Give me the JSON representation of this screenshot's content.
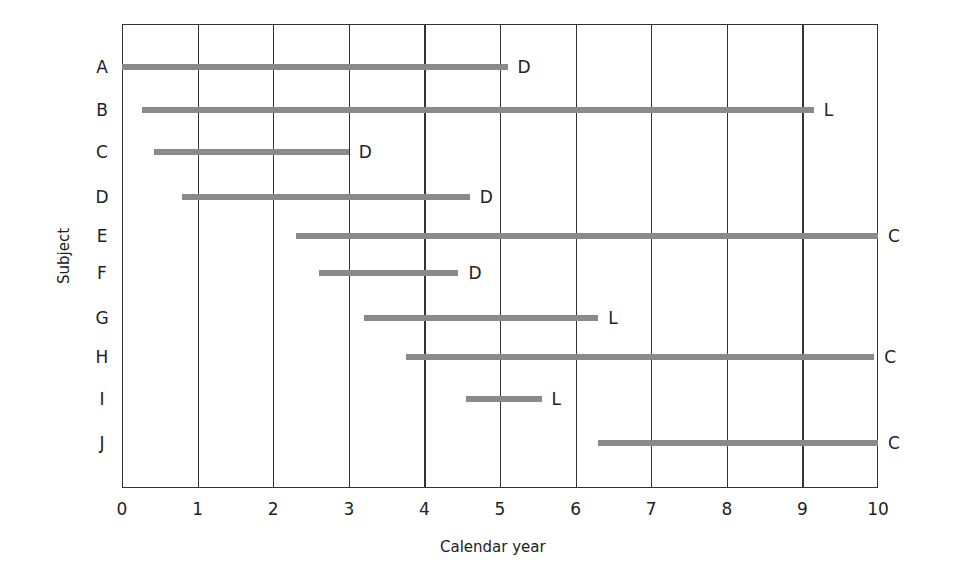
{
  "chart_data": {
    "type": "bar",
    "orientation": "horizontal",
    "subtype": "swimmer/timeline",
    "title": "",
    "xlabel": "Calendar year",
    "ylabel": "Subject",
    "xlim": [
      0,
      10
    ],
    "xticks": [
      "0",
      "1",
      "2",
      "3",
      "4",
      "5",
      "6",
      "7",
      "8",
      "9",
      "10"
    ],
    "grid": {
      "vertical": true,
      "horizontal": false
    },
    "bar_color": "#8a8a8a",
    "categories": [
      "A",
      "B",
      "C",
      "D",
      "E",
      "F",
      "G",
      "H",
      "I",
      "J"
    ],
    "series": [
      {
        "subject": "A",
        "start": 0.0,
        "end": 5.1,
        "outcome": "D"
      },
      {
        "subject": "B",
        "start": 0.27,
        "end": 9.15,
        "outcome": "L"
      },
      {
        "subject": "C",
        "start": 0.42,
        "end": 3.0,
        "outcome": "D"
      },
      {
        "subject": "D",
        "start": 0.8,
        "end": 4.6,
        "outcome": "D"
      },
      {
        "subject": "E",
        "start": 2.3,
        "end": 10.0,
        "outcome": "C"
      },
      {
        "subject": "F",
        "start": 2.6,
        "end": 4.45,
        "outcome": "D"
      },
      {
        "subject": "G",
        "start": 3.2,
        "end": 6.3,
        "outcome": "L"
      },
      {
        "subject": "H",
        "start": 3.75,
        "end": 9.95,
        "outcome": "C"
      },
      {
        "subject": "I",
        "start": 4.55,
        "end": 5.55,
        "outcome": "L"
      },
      {
        "subject": "J",
        "start": 6.3,
        "end": 10.0,
        "outcome": "C"
      }
    ]
  }
}
